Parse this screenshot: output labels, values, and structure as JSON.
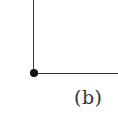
{
  "diagram": {
    "caption": "(b)",
    "elements": [
      {
        "type": "line",
        "orientation": "vertical",
        "description": "vertical segment from top edge down to origin point"
      },
      {
        "type": "line",
        "orientation": "horizontal",
        "description": "horizontal segment from origin point to right edge"
      },
      {
        "type": "point",
        "description": "filled black dot at corner"
      }
    ],
    "colors": {
      "line": "#333333",
      "dot": "#111111",
      "background": "#ffffff"
    }
  }
}
